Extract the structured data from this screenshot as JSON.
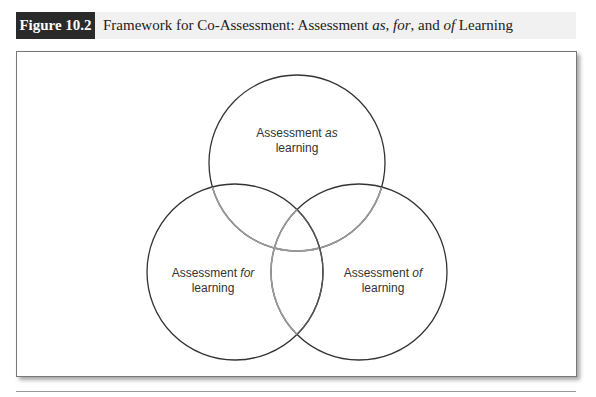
{
  "figure": {
    "label": "Figure 10.2",
    "title_parts": [
      "Framework for Co-Assessment: Assessment ",
      "as",
      ", ",
      "for",
      ", and ",
      "of",
      " Learning"
    ]
  },
  "diagram": {
    "type": "venn",
    "circles": [
      {
        "id": "as",
        "line1_prefix": "Assessment ",
        "line1_italic": "as",
        "line2": "learning",
        "cx": 297,
        "cy": 163,
        "r": 88
      },
      {
        "id": "for",
        "line1_prefix": "Assessment ",
        "line1_italic": "for",
        "line2": "learning",
        "cx": 235,
        "cy": 272,
        "r": 88
      },
      {
        "id": "of",
        "line1_prefix": "Assessment ",
        "line1_italic": "of",
        "line2": "learning",
        "cx": 359,
        "cy": 272,
        "r": 88
      }
    ],
    "stroke_color": "#333333",
    "overlap_stroke_color": "#888888"
  }
}
